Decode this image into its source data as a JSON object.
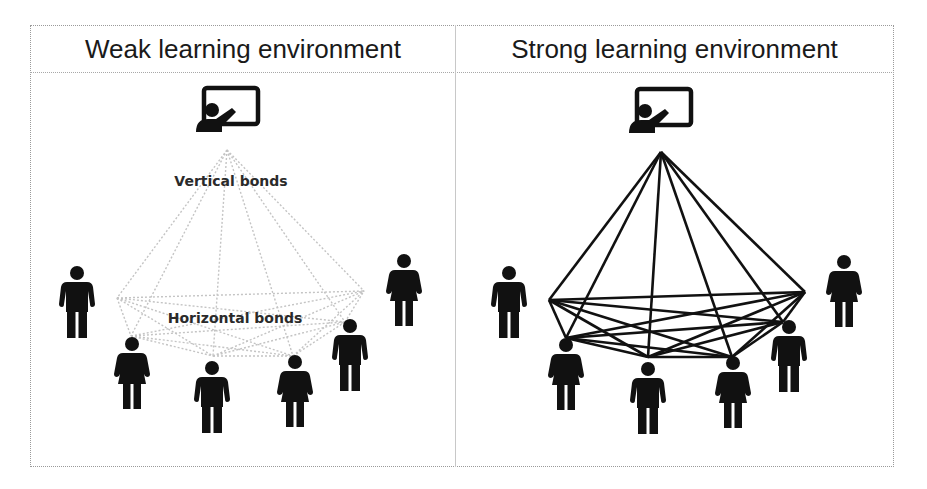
{
  "panels": [
    {
      "title": "Weak learning environment",
      "state": "weak",
      "labels": {
        "vertical": "Vertical bonds",
        "horizontal": "Horizontal bonds"
      },
      "line_color": "#c8c8c8",
      "line_style": "dotted",
      "people": [
        {
          "type": "teacher-icon"
        },
        {
          "type": "man"
        },
        {
          "type": "woman"
        },
        {
          "type": "man"
        },
        {
          "type": "woman"
        },
        {
          "type": "man"
        },
        {
          "type": "woman"
        }
      ]
    },
    {
      "title": "Strong learning environment",
      "state": "strong",
      "line_color": "#111111",
      "line_style": "solid",
      "people": [
        {
          "type": "teacher-icon"
        },
        {
          "type": "man"
        },
        {
          "type": "woman"
        },
        {
          "type": "man"
        },
        {
          "type": "woman"
        },
        {
          "type": "man"
        },
        {
          "type": "woman"
        }
      ]
    }
  ],
  "colors": {
    "icon": "#111111",
    "border": "#9a9a9a",
    "text": "#1a1a1a"
  }
}
